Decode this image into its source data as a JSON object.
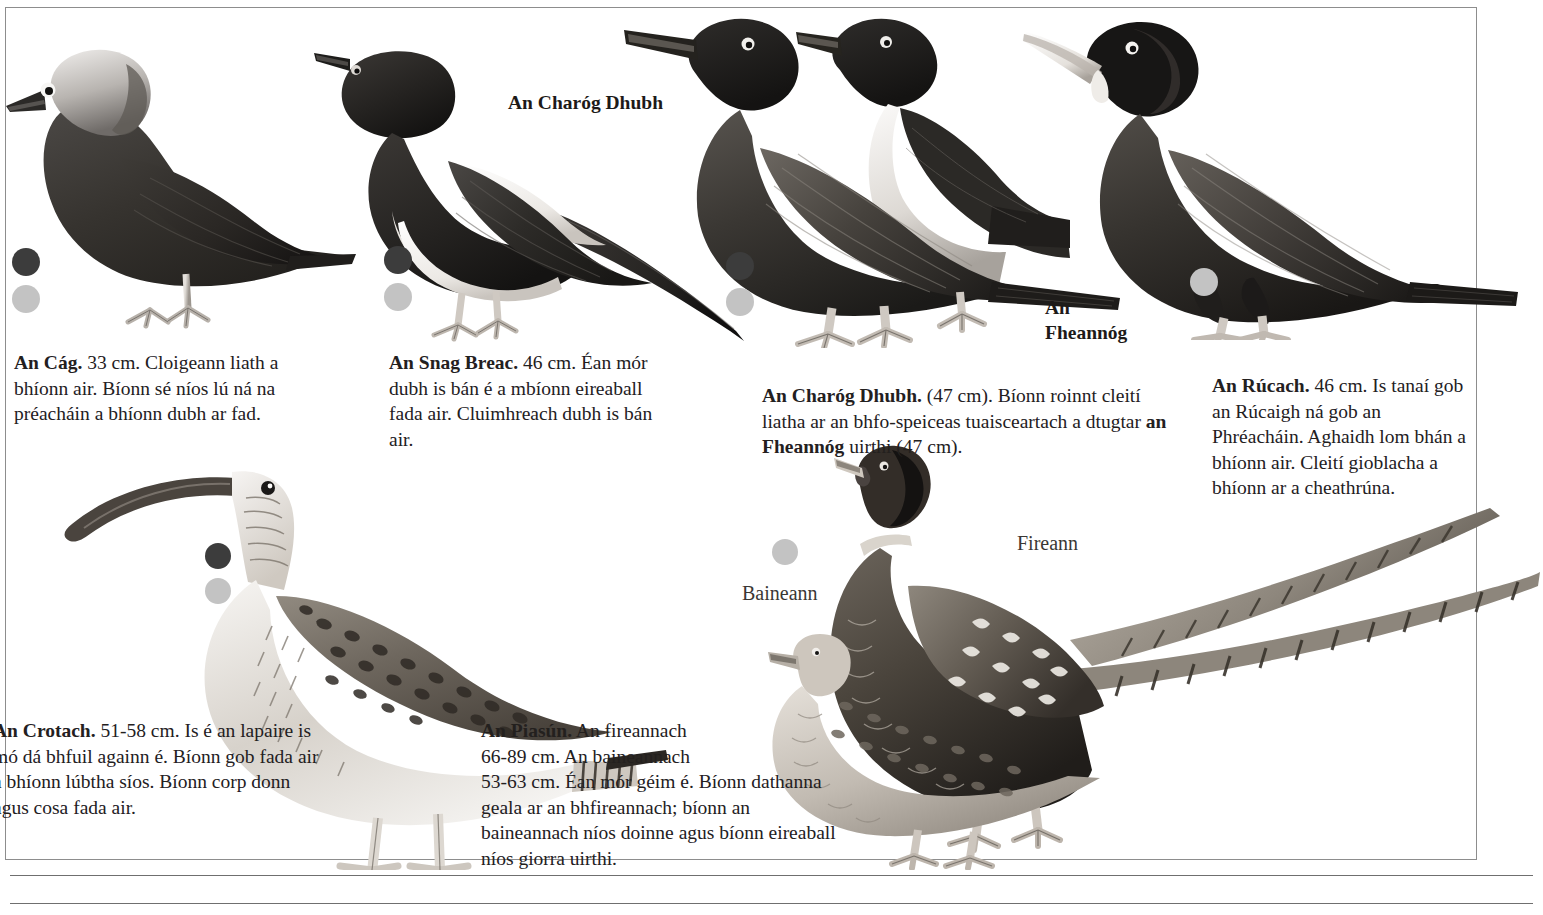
{
  "page": {
    "language": "Irish (Gaeilge)",
    "border_color": "#8d8d8d",
    "background": "#ffffff"
  },
  "markers": {
    "dark_color": "#3c3c3c",
    "light_color": "#c3c3c3"
  },
  "illustration_labels": [
    {
      "id": "charog-dhubh-callout",
      "text": "An Charóg Dhubh"
    },
    {
      "id": "fheannog-callout-line1",
      "text": "An"
    },
    {
      "id": "fheannog-callout-line2",
      "text": "Fheannóg"
    },
    {
      "id": "pheasant-female",
      "text": "Baineann"
    },
    {
      "id": "pheasant-male",
      "text": "Fireann"
    }
  ],
  "entries": {
    "cag": {
      "name": "An Cág.",
      "size": "33 cm.",
      "body": "Cloigeann liath a bhíonn air. Bíonn sé níos lú ná na préacháin a bhíonn dubh ar fad."
    },
    "snag_breac": {
      "name": "An Snag Breac.",
      "size": "46 cm.",
      "body": "Éan mór dubh is bán é a mbíonn eireaball fada air. Cluimhreach dubh is bán air."
    },
    "charog_dhubh": {
      "name": "An Charóg Dhubh.",
      "size": "(47 cm).",
      "body_part1": "Bíonn roinnt cleití liatha ar an bhfo-speiceas tuaisceartach a dtugtar ",
      "body_emphasis": "an Fheannóg",
      "body_part2": " uirthi (47 cm)."
    },
    "rucach": {
      "name": "An Rúcach.",
      "size": "46 cm.",
      "body": "Is tanaí gob an Rúcaigh ná gob an Phréacháin. Aghaidh lom bhán a bhíonn air. Cleití gioblacha a bhíonn ar a cheathrúna."
    },
    "crotach": {
      "name": "An Crotach.",
      "size": "51-58 cm.",
      "body": "Is é an lapaire is mó dá bhfuil againn é. Bíonn gob fada air a bhíonn lúbtha síos. Bíonn corp donn agus cosa fada air."
    },
    "piasun": {
      "name": "An Piasún.",
      "body_line1": "An fireannach",
      "body_line2": "66-89 cm.  An baineannach",
      "body_line3": "53-63 cm. Éan mór géim é. Bíonn dathanna",
      "body_line4": "geala ar an bhfireannach; bíonn an",
      "body_line5": "baineannach níos doinne agus bíonn eireaball",
      "body_line6": "níos giorra uirthi."
    }
  }
}
